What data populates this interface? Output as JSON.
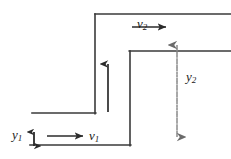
{
  "figure": {
    "type": "line-diagram",
    "width": 231,
    "height": 159,
    "background_color": "#ffffff",
    "line_color": "#3a3a3a",
    "text_color": "#1a1a1a",
    "labels": {
      "y1": {
        "base": "y",
        "sub": "1",
        "text": "y1"
      },
      "v1": {
        "base": "v",
        "sub": "1",
        "text": "v1"
      },
      "y2": {
        "base": "y",
        "sub": "2",
        "text": "y2"
      },
      "v2": {
        "base": "v",
        "sub": "2",
        "text": "v2"
      }
    },
    "geometry": {
      "channel_bottom_y": 145,
      "lower_deck_y": 113,
      "upper_deck_y": 51,
      "top_surface_y": 14,
      "left_wall_x": 95,
      "step_wall_x": 130,
      "bottom_left_x": 30,
      "lower_deck_left_x": 32,
      "right_edge_x": 231
    },
    "arrows": {
      "v1": {
        "from_x": 47,
        "to_x": 85,
        "y": 136,
        "style": "solid",
        "heads": "single"
      },
      "v2": {
        "from_x": 132,
        "to_x": 168,
        "y": 27,
        "style": "solid",
        "heads": "single"
      },
      "riser": {
        "x": 108,
        "from_y": 112,
        "to_y": 62,
        "style": "solid",
        "heads": "single"
      },
      "y1": {
        "x": 34,
        "from_y": 130,
        "to_y": 147,
        "style": "solid",
        "heads": "double"
      },
      "y2": {
        "x": 177,
        "from_y": 43,
        "to_y": 138,
        "style": "dashed",
        "heads": "double"
      }
    }
  }
}
